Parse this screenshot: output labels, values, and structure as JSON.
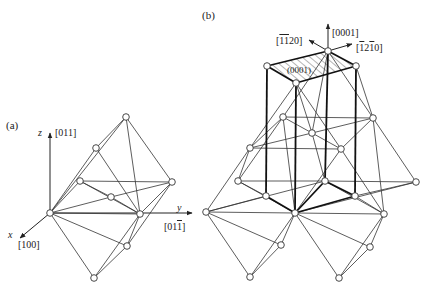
{
  "panel_a": {
    "label": "(a)",
    "axes": {
      "z": {
        "name": "z",
        "dir": "[011]"
      },
      "y": {
        "name": "y",
        "dir_prefix": "[01",
        "dir_bar": "1",
        "dir_suffix": "]"
      },
      "x": {
        "name": "x",
        "dir": "[100]"
      }
    },
    "nodes": [
      [
        126,
        17
      ],
      [
        96,
        48
      ],
      [
        80,
        81
      ],
      [
        111,
        97
      ],
      [
        172,
        82
      ],
      [
        50,
        113
      ],
      [
        140,
        114
      ],
      [
        127,
        146
      ],
      [
        94,
        178
      ]
    ],
    "edges": [
      [
        0,
        1
      ],
      [
        0,
        5
      ],
      [
        0,
        4
      ],
      [
        1,
        5
      ],
      [
        1,
        6
      ],
      [
        2,
        5
      ],
      [
        2,
        4
      ],
      [
        2,
        6
      ],
      [
        3,
        5
      ],
      [
        3,
        4
      ],
      [
        5,
        6
      ],
      [
        4,
        6
      ],
      [
        5,
        7
      ],
      [
        6,
        7
      ],
      [
        4,
        7
      ],
      [
        5,
        8
      ],
      [
        6,
        8
      ],
      [
        7,
        8
      ],
      [
        2,
        3
      ],
      [
        3,
        6
      ],
      [
        0,
        6
      ]
    ],
    "offset": [
      0,
      100
    ]
  },
  "panel_b": {
    "label": "(b)",
    "directions": {
      "c": "[0001]",
      "a1": {
        "prefix": "[",
        "bar1": "1",
        "mid": "",
        "bar2": "1",
        "suffix": "20]"
      },
      "a2": {
        "prefix": "[",
        "bar1": "1",
        "mid": "2",
        "bar2": "1",
        "suffix": "0]"
      }
    },
    "plane_label": "(0001)",
    "nodes": [
      [
        328,
        51
      ],
      [
        267,
        66
      ],
      [
        356,
        66
      ],
      [
        296,
        83
      ],
      [
        283,
        117
      ],
      [
        373,
        118
      ],
      [
        312,
        133
      ],
      [
        250,
        148
      ],
      [
        341,
        149
      ],
      [
        238,
        181
      ],
      [
        325,
        181
      ],
      [
        416,
        182
      ],
      [
        266,
        196
      ],
      [
        355,
        196
      ],
      [
        206,
        212
      ],
      [
        295,
        213
      ],
      [
        384,
        214
      ],
      [
        281,
        245
      ],
      [
        370,
        247
      ],
      [
        250,
        277
      ],
      [
        339,
        278
      ]
    ],
    "prism_edges": [
      [
        1,
        0
      ],
      [
        0,
        2
      ],
      [
        2,
        3
      ],
      [
        3,
        1
      ],
      [
        1,
        12
      ],
      [
        3,
        15
      ],
      [
        0,
        10
      ],
      [
        2,
        13
      ],
      [
        12,
        15
      ],
      [
        15,
        10
      ],
      [
        10,
        13
      ],
      [
        13,
        15
      ]
    ],
    "lattice_edges": [
      [
        3,
        7
      ],
      [
        3,
        6
      ],
      [
        3,
        8
      ],
      [
        0,
        4
      ],
      [
        0,
        5
      ],
      [
        0,
        6
      ],
      [
        2,
        5
      ],
      [
        4,
        5
      ],
      [
        4,
        6
      ],
      [
        5,
        6
      ],
      [
        7,
        8
      ],
      [
        7,
        4
      ],
      [
        8,
        6
      ],
      [
        8,
        5
      ],
      [
        7,
        6
      ],
      [
        4,
        9
      ],
      [
        4,
        15
      ],
      [
        5,
        11
      ],
      [
        5,
        16
      ],
      [
        7,
        14
      ],
      [
        7,
        9
      ],
      [
        8,
        15
      ],
      [
        8,
        16
      ],
      [
        6,
        10
      ],
      [
        9,
        10
      ],
      [
        10,
        11
      ],
      [
        14,
        15
      ],
      [
        15,
        16
      ],
      [
        9,
        15
      ],
      [
        14,
        10
      ],
      [
        10,
        16
      ],
      [
        11,
        15
      ],
      [
        14,
        17
      ],
      [
        15,
        17
      ],
      [
        14,
        19
      ],
      [
        15,
        18
      ],
      [
        16,
        18
      ],
      [
        16,
        20
      ],
      [
        17,
        19
      ],
      [
        18,
        20
      ],
      [
        15,
        19
      ],
      [
        15,
        20
      ],
      [
        9,
        12
      ],
      [
        12,
        14
      ],
      [
        11,
        13
      ],
      [
        13,
        16
      ]
    ]
  }
}
